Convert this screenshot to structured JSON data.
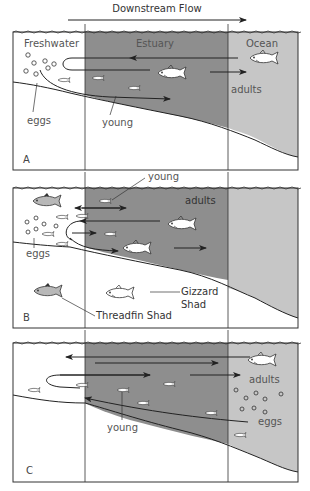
{
  "title": "Downstream Flow",
  "colors": {
    "estuary": "#8e8e8e",
    "ocean": "#c6c6c6",
    "line": "#333333",
    "fish_fill": "#ffffff",
    "threadfin_fill": "#b8b8b8"
  },
  "zones": {
    "freshwater": "Freshwater",
    "estuary": "Estuary",
    "ocean": "Ocean"
  },
  "panels": [
    {
      "letter": "A",
      "labels": {
        "eggs": "eggs",
        "young": "young",
        "adults": "adults"
      }
    },
    {
      "letter": "B",
      "labels": {
        "eggs": "eggs",
        "young": "young",
        "adults": "adults",
        "threadfin": "Threadfin Shad",
        "gizzard_1": "Gizzard",
        "gizzard_2": "Shad"
      }
    },
    {
      "letter": "C",
      "labels": {
        "eggs": "eggs",
        "young": "young",
        "adults": "adults"
      }
    }
  ]
}
